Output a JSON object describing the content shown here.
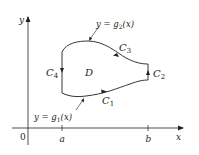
{
  "diagram": {
    "axes": {
      "x_label": "x",
      "y_label": "y",
      "origin_label": "0",
      "tick_a": "a",
      "tick_b": "b"
    },
    "region_label": "D",
    "curves": {
      "c1": {
        "label": "C",
        "sub": "1"
      },
      "c2": {
        "label": "C",
        "sub": "2"
      },
      "c3": {
        "label": "C",
        "sub": "3"
      },
      "c4": {
        "label": "C",
        "sub": "4"
      }
    },
    "annotations": {
      "upper": {
        "prefix": "y = g",
        "sub": "2",
        "suffix": "(x)"
      },
      "lower": {
        "prefix": "y = g",
        "sub": "1",
        "suffix": "(x)"
      }
    },
    "colors": {
      "ink": "#231f20",
      "background": "#ffffff"
    }
  }
}
